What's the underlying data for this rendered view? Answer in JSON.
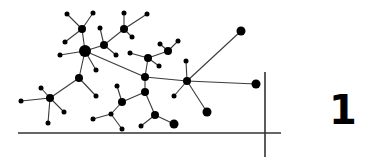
{
  "figure": {
    "number_label": "1",
    "colors": {
      "node": "#000000",
      "edge": "#3a3a3a",
      "axis": "#333333",
      "background": "#ffffff"
    },
    "axes": {
      "horizontal": {
        "x1": 18,
        "y1": 133,
        "x2": 281,
        "y2": 133
      },
      "vertical": {
        "x1": 265,
        "y1": 72,
        "x2": 265,
        "y2": 157
      }
    },
    "nodes": [
      {
        "id": "A",
        "x": 67,
        "y": 14,
        "r": 2.5
      },
      {
        "id": "B",
        "x": 93,
        "y": 13,
        "r": 2.5
      },
      {
        "id": "C",
        "x": 82,
        "y": 29,
        "r": 4
      },
      {
        "id": "D",
        "x": 65,
        "y": 42,
        "r": 2.5
      },
      {
        "id": "E",
        "x": 85,
        "y": 51,
        "r": 6
      },
      {
        "id": "F",
        "x": 60,
        "y": 55,
        "r": 2.5
      },
      {
        "id": "G",
        "x": 96,
        "y": 70,
        "r": 2.5
      },
      {
        "id": "H",
        "x": 104,
        "y": 45,
        "r": 4
      },
      {
        "id": "I",
        "x": 100,
        "y": 28,
        "r": 2.5
      },
      {
        "id": "J",
        "x": 116,
        "y": 55,
        "r": 2.5
      },
      {
        "id": "K",
        "x": 124,
        "y": 29,
        "r": 4
      },
      {
        "id": "L",
        "x": 124,
        "y": 13,
        "r": 2.5
      },
      {
        "id": "M",
        "x": 147,
        "y": 14,
        "r": 2.5
      },
      {
        "id": "N",
        "x": 132,
        "y": 37,
        "r": 2.5
      },
      {
        "id": "O",
        "x": 145,
        "y": 77,
        "r": 4
      },
      {
        "id": "P",
        "x": 148,
        "y": 58,
        "r": 4
      },
      {
        "id": "Q",
        "x": 130,
        "y": 53,
        "r": 2.5
      },
      {
        "id": "R",
        "x": 159,
        "y": 66,
        "r": 2.5
      },
      {
        "id": "S",
        "x": 168,
        "y": 51,
        "r": 4
      },
      {
        "id": "T",
        "x": 160,
        "y": 44,
        "r": 2.5
      },
      {
        "id": "U",
        "x": 178,
        "y": 41,
        "r": 2.5
      },
      {
        "id": "V",
        "x": 187,
        "y": 81,
        "r": 4
      },
      {
        "id": "W",
        "x": 241,
        "y": 31,
        "r": 4.5
      },
      {
        "id": "X",
        "x": 256,
        "y": 84,
        "r": 4.5
      },
      {
        "id": "Y",
        "x": 186,
        "y": 61,
        "r": 2.5
      },
      {
        "id": "Z",
        "x": 174,
        "y": 96,
        "r": 2.5
      },
      {
        "id": "AA",
        "x": 207,
        "y": 112,
        "r": 4.5
      },
      {
        "id": "BB",
        "x": 79,
        "y": 78,
        "r": 4
      },
      {
        "id": "CC",
        "x": 96,
        "y": 96,
        "r": 2.5
      },
      {
        "id": "DD",
        "x": 50,
        "y": 98,
        "r": 4
      },
      {
        "id": "EE",
        "x": 21,
        "y": 101,
        "r": 2.5
      },
      {
        "id": "FF",
        "x": 41,
        "y": 88,
        "r": 2.5
      },
      {
        "id": "GG",
        "x": 64,
        "y": 112,
        "r": 2.5
      },
      {
        "id": "HH",
        "x": 48,
        "y": 123,
        "r": 2.5
      },
      {
        "id": "II",
        "x": 145,
        "y": 92,
        "r": 4
      },
      {
        "id": "JJ",
        "x": 122,
        "y": 102,
        "r": 4
      },
      {
        "id": "KK",
        "x": 117,
        "y": 86,
        "r": 2.5
      },
      {
        "id": "LL",
        "x": 111,
        "y": 114,
        "r": 2.5
      },
      {
        "id": "MM",
        "x": 93,
        "y": 119,
        "r": 2.5
      },
      {
        "id": "NN",
        "x": 122,
        "y": 129,
        "r": 2.5
      },
      {
        "id": "OO",
        "x": 155,
        "y": 115,
        "r": 4
      },
      {
        "id": "PP",
        "x": 174,
        "y": 124,
        "r": 4.5
      },
      {
        "id": "QQ",
        "x": 141,
        "y": 126,
        "r": 2.5
      }
    ],
    "edges": [
      [
        "A",
        "C"
      ],
      [
        "B",
        "C"
      ],
      [
        "C",
        "E"
      ],
      [
        "D",
        "C"
      ],
      [
        "E",
        "F"
      ],
      [
        "E",
        "G"
      ],
      [
        "E",
        "H"
      ],
      [
        "E",
        "O"
      ],
      [
        "E",
        "BB"
      ],
      [
        "H",
        "I"
      ],
      [
        "H",
        "J"
      ],
      [
        "H",
        "K"
      ],
      [
        "K",
        "L"
      ],
      [
        "K",
        "M"
      ],
      [
        "K",
        "N"
      ],
      [
        "O",
        "P"
      ],
      [
        "O",
        "V"
      ],
      [
        "O",
        "II"
      ],
      [
        "P",
        "Q"
      ],
      [
        "P",
        "R"
      ],
      [
        "P",
        "S"
      ],
      [
        "S",
        "T"
      ],
      [
        "S",
        "U"
      ],
      [
        "V",
        "W"
      ],
      [
        "V",
        "X"
      ],
      [
        "V",
        "Y"
      ],
      [
        "V",
        "Z"
      ],
      [
        "V",
        "AA"
      ],
      [
        "BB",
        "CC"
      ],
      [
        "BB",
        "DD"
      ],
      [
        "DD",
        "EE"
      ],
      [
        "DD",
        "FF"
      ],
      [
        "DD",
        "GG"
      ],
      [
        "DD",
        "HH"
      ],
      [
        "II",
        "JJ"
      ],
      [
        "II",
        "OO"
      ],
      [
        "JJ",
        "KK"
      ],
      [
        "JJ",
        "LL"
      ],
      [
        "LL",
        "MM"
      ],
      [
        "LL",
        "NN"
      ],
      [
        "OO",
        "PP"
      ],
      [
        "OO",
        "QQ"
      ]
    ]
  }
}
